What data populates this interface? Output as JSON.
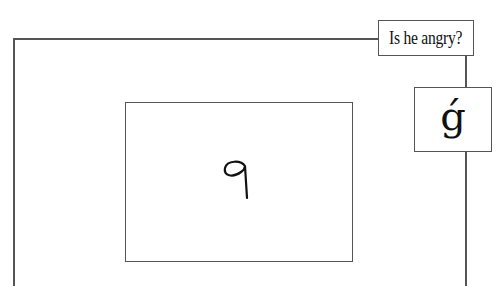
{
  "question_label": {
    "text": "Is he angry?"
  },
  "symbol_box": {
    "glyph": "ǵ"
  },
  "stimulus_box": {
    "digit": "9",
    "style": "handwritten"
  },
  "colors": {
    "line": "#555555",
    "text": "#111111",
    "background": "#ffffff"
  }
}
